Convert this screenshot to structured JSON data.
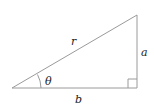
{
  "diagram": {
    "type": "right-triangle",
    "stroke_color": "#9a9a9a",
    "text_color": "#222222",
    "labels": {
      "hypotenuse": "r",
      "opposite": "a",
      "adjacent": "b",
      "angle": "θ"
    },
    "vertices": {
      "angle_vertex": [
        12,
        88
      ],
      "right_angle_vertex": [
        137,
        88
      ],
      "top_vertex": [
        137,
        15
      ]
    }
  }
}
